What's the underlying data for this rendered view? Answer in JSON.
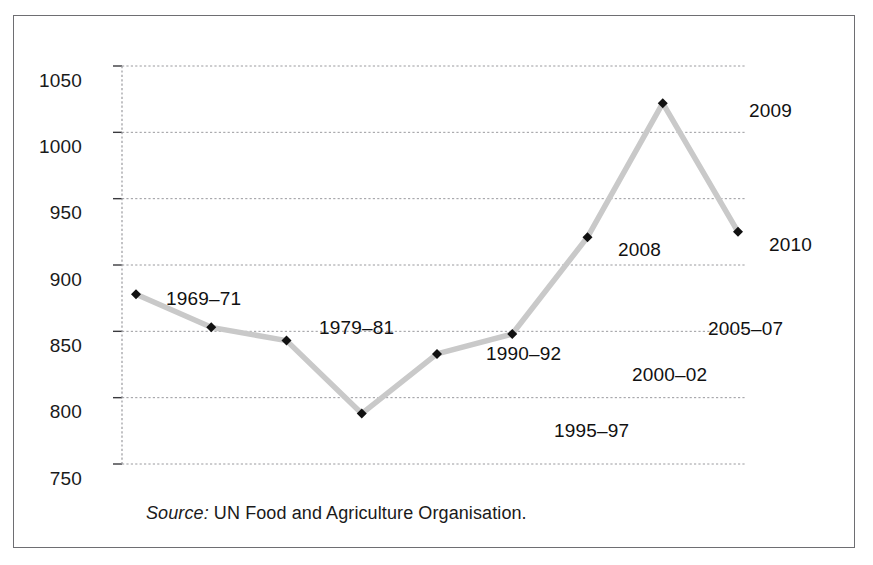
{
  "figure": {
    "source_note_prefix": "Source:",
    "source_note_text": " UN Food and Agriculture Organisation."
  },
  "chart_data": {
    "type": "line",
    "title": "",
    "subtitle": "",
    "xlabel": "",
    "ylabel": "",
    "categories": [
      "1969–71",
      "1979–81",
      "1990–92",
      "1995–97",
      "2000–02",
      "2005–07",
      "2008",
      "2009",
      "2010"
    ],
    "values": [
      878,
      853,
      843,
      788,
      833,
      848,
      921,
      1022,
      925
    ],
    "point_labels": [
      "1969–71",
      "1979–81",
      "1990–92",
      "1995–97",
      "2000–02",
      "2005–07",
      "2008",
      "2009",
      "2010"
    ],
    "ylim": [
      750,
      1050
    ],
    "yticks": [
      750,
      800,
      850,
      900,
      950,
      1000,
      1050
    ],
    "ytick_labels": [
      "750",
      "800",
      "850",
      "900",
      "950",
      "1000",
      "1050"
    ],
    "grid": true,
    "grid_style": "dashed",
    "legend": "none",
    "series_color": "#c9c9c9",
    "marker_color": "#111111",
    "marker_shape": "diamond",
    "axis_color": "#9a9a9e",
    "frame_color": "#6e6e72"
  },
  "labels": {
    "items": [
      {
        "text": "1969–71",
        "x": 152,
        "y": 272,
        "anchor": "left"
      },
      {
        "text": "1979–81",
        "x": 305,
        "y": 301,
        "anchor": "left"
      },
      {
        "text": "1990–92",
        "x": 472,
        "y": 327,
        "anchor": "left"
      },
      {
        "text": "1995–97",
        "x": 540,
        "y": 404,
        "anchor": "left"
      },
      {
        "text": "2000–02",
        "x": 618,
        "y": 348,
        "anchor": "left"
      },
      {
        "text": "2005–07",
        "x": 694,
        "y": 302,
        "anchor": "left"
      },
      {
        "text": "2008",
        "x": 647,
        "y": 223,
        "anchor": "right"
      },
      {
        "text": "2009",
        "x": 735,
        "y": 84,
        "anchor": "left"
      },
      {
        "text": "2010",
        "x": 755,
        "y": 218,
        "anchor": "left"
      }
    ]
  },
  "yaxis": {
    "tick_label_x": 68,
    "ticks": [
      {
        "label": "1050",
        "y": 54
      },
      {
        "label": "1000",
        "y": 120
      },
      {
        "label": "950",
        "y": 186
      },
      {
        "label": "900",
        "y": 253
      },
      {
        "label": "850",
        "y": 319
      },
      {
        "label": "800",
        "y": 385
      },
      {
        "label": "750",
        "y": 452
      }
    ]
  }
}
